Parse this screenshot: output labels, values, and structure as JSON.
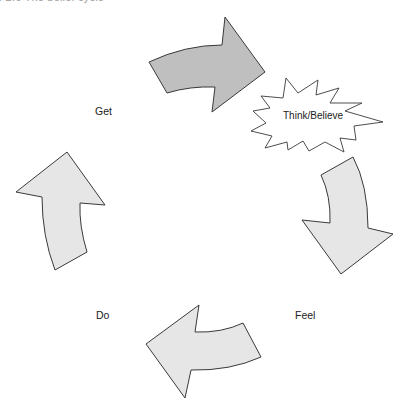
{
  "caption": "e 2.6   The belief cycle",
  "diagram": {
    "title": "The belief cycle",
    "stages": [
      {
        "id": "get",
        "label": "Get"
      },
      {
        "id": "think",
        "label": "Think/Believe"
      },
      {
        "id": "feel",
        "label": "Feel"
      },
      {
        "id": "do",
        "label": "Do"
      }
    ],
    "arrows": [
      {
        "id": "get-to-think",
        "from": "Get",
        "to": "Think/Believe",
        "fill": "#bfbfbf"
      },
      {
        "id": "think-to-feel",
        "from": "Think/Believe",
        "to": "Feel",
        "fill": "#e6e6e6"
      },
      {
        "id": "feel-to-do",
        "from": "Feel",
        "to": "Do",
        "fill": "#e6e6e6"
      },
      {
        "id": "do-to-get",
        "from": "Do",
        "to": "Get",
        "fill": "#e6e6e6"
      }
    ],
    "colors": {
      "outline": "#3a3a3a",
      "highlight_arrow": "#bfbfbf",
      "normal_arrow": "#e6e6e6",
      "burst_fill": "#ffffff"
    }
  }
}
